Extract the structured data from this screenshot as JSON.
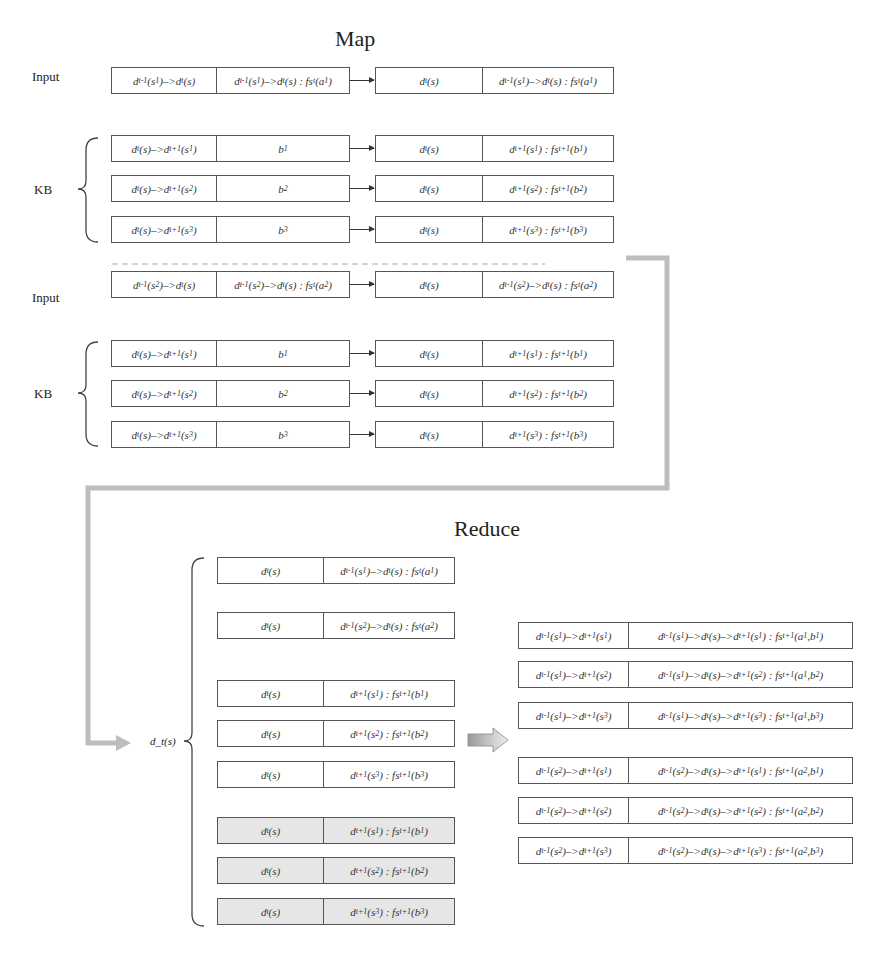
{
  "map": {
    "title": "Map",
    "blocks": [
      {
        "label": "Input",
        "rows": [
          {
            "in": [
              "d_{t-1}(s_1)->d_t(s)",
              "d_{t-1}(s_1)->d_t(s) : fs_t(a_1)"
            ],
            "out": [
              "d_t(s)",
              "d_{t-1}(s_1)->d_t(s) : fs_t(a_1)"
            ]
          }
        ]
      },
      {
        "label": "KB",
        "rows": [
          {
            "in": [
              "d_t(s)->d_{t+1}(s_1)",
              "b_1"
            ],
            "out": [
              "d_t(s)",
              "d_{t+1}(s_1) : fs_{t+1}(b_1)"
            ]
          },
          {
            "in": [
              "d_t(s)->d_{t+1}(s_2)",
              "b_2"
            ],
            "out": [
              "d_t(s)",
              "d_{t+1}(s_2) : fs_{t+1}(b_2)"
            ]
          },
          {
            "in": [
              "d_t(s)->d_{t+1}(s_3)",
              "b_3"
            ],
            "out": [
              "d_t(s)",
              "d_{t+1}(s_3) : fs_{t+1}(b_3)"
            ]
          }
        ]
      },
      {
        "label": "Input",
        "rows": [
          {
            "in": [
              "d_{t-1}(s_2)->d_t(s)",
              "d_{t-1}(s_2)->d_t(s) : fs_t(a_2)"
            ],
            "out": [
              "d_t(s)",
              "d_{t-1}(s_2)->d_t(s) : fs_t(a_2)"
            ]
          }
        ]
      },
      {
        "label": "KB",
        "rows": [
          {
            "in": [
              "d_t(s)->d_{t+1}(s_1)",
              "b_1"
            ],
            "out": [
              "d_t(s)",
              "d_{t+1}(s_1) : fs_{t+1}(b_1)"
            ]
          },
          {
            "in": [
              "d_t(s)->d_{t+1}(s_2)",
              "b_2"
            ],
            "out": [
              "d_t(s)",
              "d_{t+1}(s_2) : fs_{t+1}(b_2)"
            ]
          },
          {
            "in": [
              "d_t(s)->d_{t+1}(s_3)",
              "b_3"
            ],
            "out": [
              "d_t(s)",
              "d_{t+1}(s_3) : fs_{t+1}(b_3)"
            ]
          }
        ]
      }
    ]
  },
  "reduce": {
    "title": "Reduce",
    "group_key": "d_t(s)",
    "inputs": [
      {
        "key": "d_t(s)",
        "value": "d_{t-1}(s_1)->d_t(s) : fs_t(a_1)",
        "shaded": false
      },
      {
        "key": "d_t(s)",
        "value": "d_{t-1}(s_2)->d_t(s) : fs_t(a_2)",
        "shaded": false
      },
      {
        "key": "d_t(s)",
        "value": "d_{t+1}(s_1) : fs_{t+1}(b_1)",
        "shaded": false
      },
      {
        "key": "d_t(s)",
        "value": "d_{t+1}(s_2) : fs_{t+1}(b_2)",
        "shaded": false
      },
      {
        "key": "d_t(s)",
        "value": "d_{t+1}(s_3) : fs_{t+1}(b_3)",
        "shaded": false
      },
      {
        "key": "d_t(s)",
        "value": "d_{t+1}(s_1) : fs_{t+1}(b_1)",
        "shaded": true
      },
      {
        "key": "d_t(s)",
        "value": "d_{t+1}(s_2) : fs_{t+1}(b_2)",
        "shaded": true
      },
      {
        "key": "d_t(s)",
        "value": "d_{t+1}(s_3) : fs_{t+1}(b_3)",
        "shaded": true
      }
    ],
    "outputs": [
      {
        "key": "d_{t-1}(s_1)->d_{t+1}(s_1)",
        "value": "d_{t-1}(s_1)->d_t(s)->d_{t+1}(s_1) : fs_{t+1}(a_1,b_1)"
      },
      {
        "key": "d_{t-1}(s_1)->d_{t+1}(s_2)",
        "value": "d_{t-1}(s_1)->d_t(s)->d_{t+1}(s_2) : fs_{t+1}(a_1,b_2)"
      },
      {
        "key": "d_{t-1}(s_1)->d_{t+1}(s_3)",
        "value": "d_{t-1}(s_1)->d_t(s)->d_{t+1}(s_3) : fs_{t+1}(a_1,b_3)"
      },
      {
        "key": "d_{t-1}(s_2)->d_{t+1}(s_1)",
        "value": "d_{t-1}(s_2)->d_t(s)->d_{t+1}(s_1) : fs_{t+1}(a_2,b_1)"
      },
      {
        "key": "d_{t-1}(s_2)->d_{t+1}(s_2)",
        "value": "d_{t-1}(s_2)->d_t(s)->d_{t+1}(s_2) : fs_{t+1}(a_2,b_2)"
      },
      {
        "key": "d_{t-1}(s_2)->d_{t+1}(s_3)",
        "value": "d_{t-1}(s_2)->d_t(s)->d_{t+1}(s_3) : fs_{t+1}(a_2,b_3)"
      }
    ]
  },
  "colors": {
    "box_border": "#555555",
    "shaded_fill": "#e6e6e6",
    "connector_gray": "#bdbdbd",
    "text": "#333333"
  }
}
